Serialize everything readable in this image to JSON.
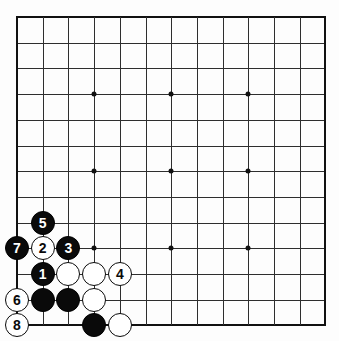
{
  "diagram": {
    "type": "go-board",
    "board_size": 13,
    "grid": {
      "origin_x": 17,
      "origin_y": 17,
      "spacing": 25.7,
      "line_color": "#2e2e2e",
      "edge_color": "#111111",
      "background": "#fdfdfd"
    },
    "star_points": [
      {
        "col": 3,
        "row": 3
      },
      {
        "col": 6,
        "row": 3
      },
      {
        "col": 9,
        "row": 3
      },
      {
        "col": 3,
        "row": 6
      },
      {
        "col": 6,
        "row": 6
      },
      {
        "col": 9,
        "row": 6
      },
      {
        "col": 3,
        "row": 9
      },
      {
        "col": 6,
        "row": 9
      },
      {
        "col": 9,
        "row": 9
      }
    ],
    "stone_colors": {
      "black": "#0a0a0a",
      "white": "#ffffff",
      "black_label": "#ffffff",
      "white_label": "#0a0a0a"
    },
    "stone_radius": 12,
    "stones": [
      {
        "id": "move-5",
        "col": 1,
        "row": 8,
        "color": "black",
        "label": "5"
      },
      {
        "id": "move-7",
        "col": 0,
        "row": 9,
        "color": "black",
        "label": "7"
      },
      {
        "id": "move-2",
        "col": 1,
        "row": 9,
        "color": "white",
        "label": "2"
      },
      {
        "id": "move-3",
        "col": 2,
        "row": 9,
        "color": "black",
        "label": "3"
      },
      {
        "id": "move-1",
        "col": 1,
        "row": 10,
        "color": "black",
        "label": "1"
      },
      {
        "id": "white-c2-r10",
        "col": 2,
        "row": 10,
        "color": "white",
        "label": ""
      },
      {
        "id": "white-c3-r10",
        "col": 3,
        "row": 10,
        "color": "white",
        "label": ""
      },
      {
        "id": "move-4",
        "col": 4,
        "row": 10,
        "color": "white",
        "label": "4"
      },
      {
        "id": "move-6",
        "col": 0,
        "row": 11,
        "color": "white",
        "label": "6"
      },
      {
        "id": "black-c1-r11",
        "col": 1,
        "row": 11,
        "color": "black",
        "label": ""
      },
      {
        "id": "black-c2-r11",
        "col": 2,
        "row": 11,
        "color": "black",
        "label": ""
      },
      {
        "id": "white-c3-r11",
        "col": 3,
        "row": 11,
        "color": "white",
        "label": ""
      },
      {
        "id": "move-8",
        "col": 0,
        "row": 12,
        "color": "white",
        "label": "8"
      },
      {
        "id": "black-c3-r12",
        "col": 3,
        "row": 12,
        "color": "black",
        "label": ""
      },
      {
        "id": "white-c4-r12",
        "col": 4,
        "row": 12,
        "color": "white",
        "label": ""
      }
    ]
  }
}
